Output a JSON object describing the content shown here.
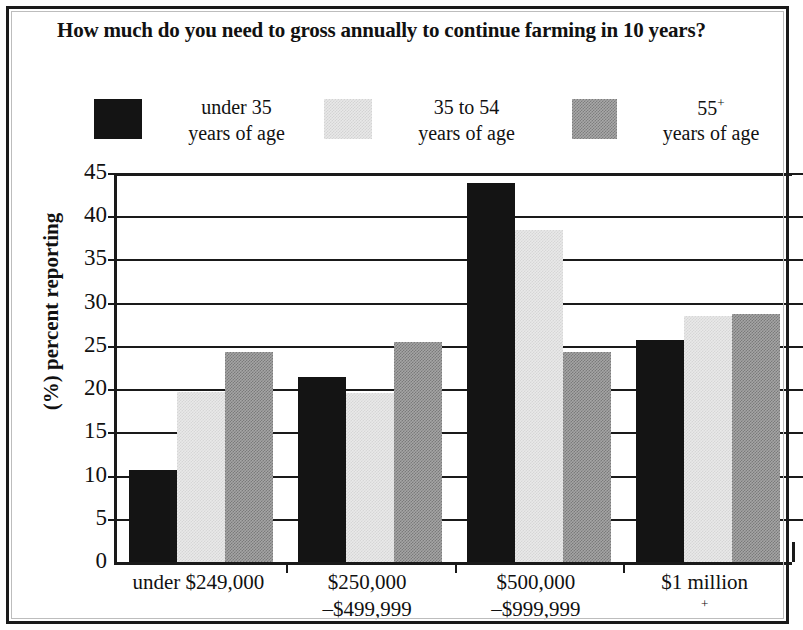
{
  "title": "How much do you need to gross annually to continue farming in 10 years?",
  "legend": [
    {
      "label_line1": "under 35",
      "label_line2": "years of age",
      "color": "#141414",
      "swatch": "legend-swatch-dark"
    },
    {
      "label_line1": "35 to 54",
      "label_line2": "years of age",
      "color": "#e8e8e8",
      "swatch": "legend-swatch-light"
    },
    {
      "label_line1": "55",
      "label_sup": "+",
      "label_line2": "years of age",
      "color": "#a8a8a8",
      "swatch": "legend-swatch-mid"
    }
  ],
  "axes": {
    "ylabel": "(%) percent reporting",
    "yticks": [
      "45",
      "40",
      "35",
      "30",
      "25",
      "20",
      "15",
      "10",
      "5",
      "0"
    ]
  },
  "xlabels": [
    {
      "line1": "under $249,000",
      "line2": ""
    },
    {
      "line1": "$250,000",
      "line2": "–$499,999"
    },
    {
      "line1": "$500,000",
      "line2": "–$999,999"
    },
    {
      "line1": "$1 million",
      "sup": "+",
      "line2": ""
    }
  ],
  "chart_data": {
    "type": "bar",
    "title": "How much do you need to gross annually to continue farming in 10 years?",
    "xlabel": "",
    "ylabel": "(%) percent reporting",
    "ylim": [
      0,
      45
    ],
    "ytick_step": 5,
    "grid": true,
    "legend_position": "top",
    "categories": [
      "under $249,000",
      "$250,000–$499,999",
      "$500,000–$999,999",
      "$1 million+"
    ],
    "series": [
      {
        "name": "under 35 years of age",
        "color": "#141414",
        "values": [
          10.6,
          21.4,
          43.8,
          25.7
        ]
      },
      {
        "name": "35 to 54 years of age",
        "color": "#e8e8e8",
        "values": [
          19.7,
          19.6,
          38.4,
          28.5
        ]
      },
      {
        "name": "55+ years of age",
        "color": "#a8a8a8",
        "values": [
          24.3,
          25.4,
          24.3,
          28.7
        ]
      }
    ]
  }
}
